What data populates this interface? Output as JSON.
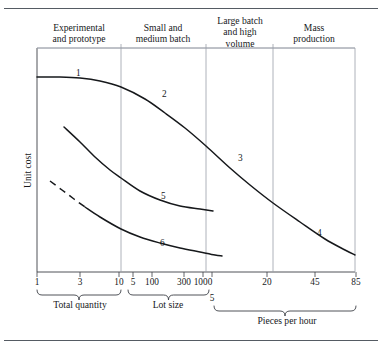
{
  "figure": {
    "title_rules": [
      "top-rule",
      "bottom-rule"
    ],
    "y_axis_label": "Unit cost"
  },
  "headers": [
    {
      "text": "Experimental\nand prototype",
      "cx": 79,
      "top": 22
    },
    {
      "text": "Small and\nmedium batch",
      "cx": 163,
      "top": 22
    },
    {
      "text": "Large batch\nand high\nvolume",
      "cx": 240,
      "top": 15
    },
    {
      "text": "Mass\nproduction",
      "cx": 314,
      "top": 22
    }
  ],
  "dividers": [
    121,
    206,
    273
  ],
  "axis_ticks": [
    {
      "label": "1",
      "x": 37
    },
    {
      "label": "3",
      "x": 80
    },
    {
      "label": "10",
      "x": 119
    },
    {
      "label": "5",
      "x": 133
    },
    {
      "label": "100",
      "x": 152
    },
    {
      "label": "300",
      "x": 184
    },
    {
      "label": "1000",
      "x": 203
    },
    {
      "label": "5",
      "x": 212
    },
    {
      "label": "20",
      "x": 267
    },
    {
      "label": "45",
      "x": 315
    },
    {
      "label": "85",
      "x": 356
    }
  ],
  "group_labels": [
    {
      "text": "Total quantity",
      "cx": 80,
      "top": 299
    },
    {
      "text": "Lot size",
      "cx": 168,
      "top": 299
    },
    {
      "text": "Pieces per hour",
      "cx": 287,
      "top": 315
    }
  ],
  "curve_labels": [
    {
      "text": "1",
      "x": 76,
      "y": 68
    },
    {
      "text": "2",
      "x": 162,
      "y": 89
    },
    {
      "text": "3",
      "x": 238,
      "y": 153
    },
    {
      "text": "4",
      "x": 317,
      "y": 228
    },
    {
      "text": "5",
      "x": 161,
      "y": 191
    },
    {
      "text": "6",
      "x": 160,
      "y": 238
    }
  ],
  "colors": {
    "curve": "#16181b",
    "axis": "#3c4046",
    "divider": "#9aa0a8",
    "rule": "#555b63",
    "text": "#16181b",
    "background": "#ffffff"
  },
  "chart_data": {
    "type": "line",
    "title": "",
    "xlabel": "Total quantity / Lot size / Pieces per hour",
    "ylabel": "Unit cost",
    "grid": false,
    "legend": "none",
    "x_axis": {
      "segments": [
        {
          "name": "Total quantity",
          "ticks": [
            1,
            3,
            10
          ]
        },
        {
          "name": "Lot size",
          "ticks": [
            5,
            100,
            300,
            1000
          ]
        },
        {
          "name": "Pieces per hour",
          "ticks": [
            5,
            20,
            45,
            85
          ]
        }
      ]
    },
    "production_categories": [
      "Experimental and prototype",
      "Small and medium batch",
      "Large batch and high volume",
      "Mass production"
    ],
    "series": [
      {
        "name": "Curve 1-2-3-4 (high unit cost process)",
        "labels_on_curve": [
          "1",
          "2",
          "3",
          "4"
        ],
        "style": "solid",
        "points": [
          [
            37,
            77
          ],
          [
            60,
            77
          ],
          [
            80,
            78
          ],
          [
            100,
            81
          ],
          [
            121,
            87
          ],
          [
            145,
            99
          ],
          [
            165,
            113
          ],
          [
            185,
            128
          ],
          [
            206,
            146
          ],
          [
            230,
            168
          ],
          [
            250,
            185
          ],
          [
            273,
            203
          ],
          [
            300,
            222
          ],
          [
            325,
            239
          ],
          [
            345,
            250
          ],
          [
            355,
            255
          ]
        ]
      },
      {
        "name": "Curve 5 (medium unit cost process)",
        "labels_on_curve": [
          "5"
        ],
        "style": "solid",
        "points": [
          [
            64,
            127
          ],
          [
            80,
            142
          ],
          [
            95,
            157
          ],
          [
            110,
            170
          ],
          [
            121,
            178
          ],
          [
            140,
            191
          ],
          [
            160,
            200
          ],
          [
            180,
            206
          ],
          [
            200,
            209
          ],
          [
            213,
            211
          ]
        ]
      },
      {
        "name": "Curve 6 (low unit cost process)",
        "labels_on_curve": [
          "6"
        ],
        "style": "dashed-then-solid",
        "dash_end_x": 85,
        "points": [
          [
            50,
            181
          ],
          [
            62,
            190
          ],
          [
            74,
            199
          ],
          [
            85,
            207
          ],
          [
            100,
            217
          ],
          [
            121,
            229
          ],
          [
            140,
            237
          ],
          [
            160,
            243
          ],
          [
            180,
            248
          ],
          [
            200,
            252
          ],
          [
            215,
            255
          ],
          [
            222,
            256
          ]
        ]
      }
    ]
  }
}
